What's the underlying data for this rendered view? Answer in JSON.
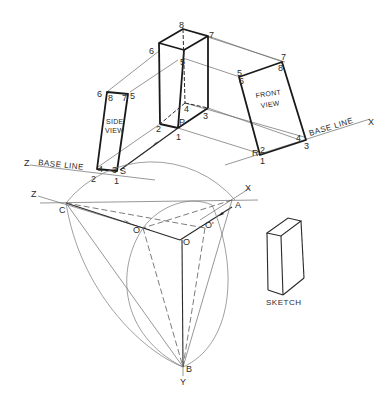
{
  "drawing": {
    "title": "Axonometric projection construction",
    "base_line_left": "BASE LINE",
    "base_line_right": "BASE LINE",
    "axis_labels": {
      "z_upper": "Z",
      "x_upper": "X",
      "z_lower": "Z",
      "x_lower": "X",
      "y_lower": "Y"
    },
    "side_view": {
      "caption_line1": "SIDE",
      "caption_line2": "VIEW",
      "vertices": {
        "top_left_outer": "6",
        "top_left_inner": "8",
        "top_right_inner": "7",
        "top_right_outer": "5",
        "bottom_left_inner": "4",
        "bottom_left_outer": "2",
        "bottom_right_inner": "3",
        "bottom_right_outer": "S",
        "bottom_tick": "1"
      }
    },
    "front_view": {
      "caption_line1": "FRONT",
      "caption_line2": "VIEW",
      "vertices": {
        "top_left_outer": "5",
        "top_left_inner": "6",
        "top_right_outer": "7",
        "top_right_inner": "8",
        "bottom_right_inner": "4",
        "bottom_right_outer": "3",
        "bottom_left_outer": "R",
        "bottom_left_inner": "2",
        "bottom_tick": "1"
      }
    },
    "axonometric_box": {
      "vertices": {
        "top_back": "8",
        "top_right": "7",
        "top_left": "6",
        "top_front": "5",
        "bottom_back": "4",
        "bottom_right": "3",
        "bottom_left": "2",
        "bottom_front": "P",
        "bottom_tick": "1"
      }
    },
    "construction_points": {
      "c": "C",
      "a": "A",
      "b": "B",
      "o": "O",
      "o_left": "O",
      "o_right": "O'"
    },
    "sketch": {
      "caption": "SKETCH"
    }
  }
}
